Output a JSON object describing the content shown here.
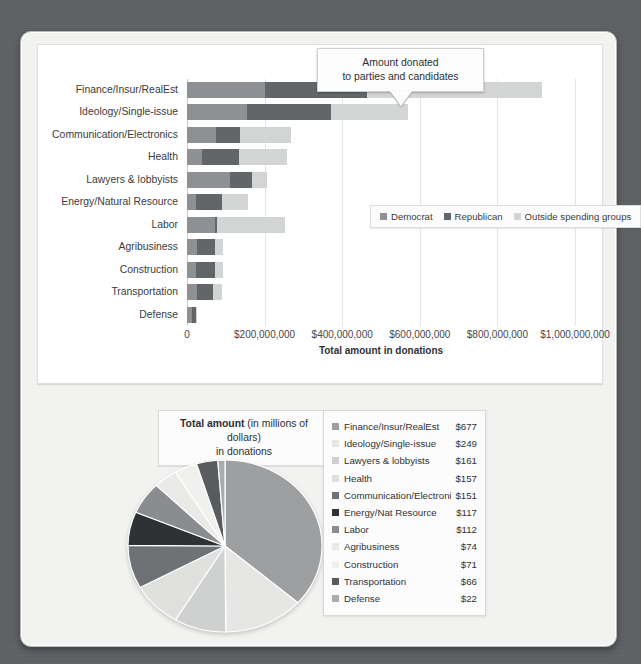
{
  "callout": {
    "line1": "Amount donated",
    "line2": "to parties and candidates"
  },
  "bar_chart": {
    "legend": [
      {
        "label": "Democrat",
        "color": "#8e9093"
      },
      {
        "label": "Republican",
        "color": "#636669"
      },
      {
        "label": "Outside spending groups",
        "color": "#d3d4d4"
      }
    ],
    "axis_title": "Total amount in donations",
    "ticks": [
      "0",
      "$200,000,000",
      "$400,000,000",
      "$600,000,000",
      "$800,000,000",
      "$1,000,000,000"
    ]
  },
  "pie_section": {
    "title_bold": "Total amount",
    "title_rest": " (in millions of dollars)",
    "title_line2": "in donations"
  },
  "chart_data": [
    {
      "type": "bar",
      "orientation": "horizontal",
      "stacked": true,
      "title": "Amount donated to parties and candidates",
      "xlabel": "Total amount in donations",
      "ylabel": "",
      "xlim": [
        0,
        1000000000
      ],
      "xticks": [
        0,
        200000000,
        400000000,
        600000000,
        800000000,
        1000000000
      ],
      "xtick_labels": [
        "0",
        "$200,000,000",
        "$400,000,000",
        "$600,000,000",
        "$800,000,000",
        "$1,000,000,000"
      ],
      "grid": true,
      "legend": [
        "Democrat",
        "Republican",
        "Outside spending groups"
      ],
      "legend_position": "middle-right inside plot",
      "categories": [
        "Finance/Insur/RealEst",
        "Ideology/Single-issue",
        "Communication/Electronics",
        "Health",
        "Lawyers & lobbyists",
        "Energy/Natural Resource",
        "Labor",
        "Agribusiness",
        "Construction",
        "Transportation",
        "Defense"
      ],
      "series": [
        {
          "name": "Democrat",
          "color": "#8e9093",
          "values": [
            200000000,
            155000000,
            75000000,
            38000000,
            110000000,
            22000000,
            72000000,
            25000000,
            22000000,
            25000000,
            12000000
          ]
        },
        {
          "name": "Republican",
          "color": "#636669",
          "values": [
            265000000,
            215000000,
            62000000,
            95000000,
            57000000,
            68000000,
            5000000,
            47000000,
            49000000,
            41000000,
            10000000
          ]
        },
        {
          "name": "Outside spending groups",
          "color": "#d3d4d4",
          "values": [
            450000000,
            200000000,
            130000000,
            125000000,
            40000000,
            68000000,
            175000000,
            22000000,
            22000000,
            24000000,
            5000000
          ]
        }
      ]
    },
    {
      "type": "pie",
      "title": "Total amount (in millions of dollars) in donations",
      "units": "millions of dollars",
      "start_angle_deg": 0,
      "direction": "clockwise",
      "legend_position": "right",
      "labels": [
        "Finance/Insur/RealEst",
        "Ideology/Single-issue",
        "Lawyers & lobbyists",
        "Health",
        "Communication/Electronics",
        "Energy/Nat Resource",
        "Labor",
        "Agribusiness",
        "Construction",
        "Transportation",
        "Defense"
      ],
      "values": [
        677,
        249,
        161,
        157,
        151,
        117,
        112,
        74,
        71,
        66,
        22
      ],
      "value_labels": [
        "$677",
        "$249",
        "$161",
        "$157",
        "$151",
        "$117",
        "$112",
        "$74",
        "$71",
        "$66",
        "$22"
      ],
      "colors": [
        "#9d9fa1",
        "#e6e6e5",
        "#cfd0d0",
        "#e0e0df",
        "#6f7275",
        "#2e3234",
        "#8a8c8f",
        "#e9e9e8",
        "#f0f0ef",
        "#585c5f",
        "#a9abad"
      ]
    }
  ]
}
